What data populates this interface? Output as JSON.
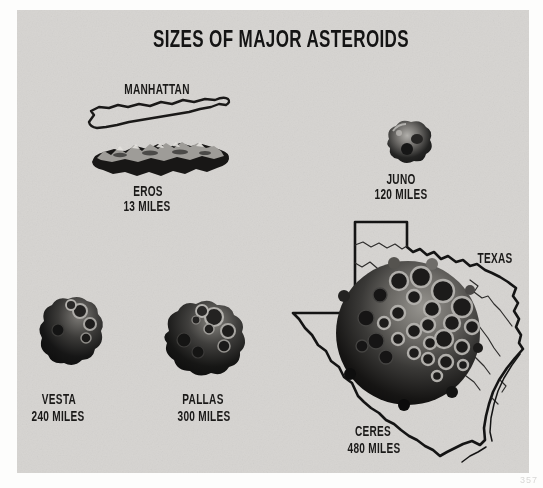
{
  "figure": {
    "title": "SIZES OF MAJOR ASTEROIDS",
    "manhattan_label": "MANHATTAN",
    "texas_label": "TEXAS",
    "asteroids": [
      {
        "name": "EROS",
        "size": "13 MILES"
      },
      {
        "name": "JUNO",
        "size": "120 MILES"
      },
      {
        "name": "VESTA",
        "size": "240 MILES"
      },
      {
        "name": "PALLAS",
        "size": "300 MILES"
      },
      {
        "name": "CERES",
        "size": "480 MILES"
      }
    ],
    "page_number": "357",
    "colors": {
      "panel_background": "#d6d4d1",
      "paper_white": "#fdfdfc",
      "ink": "#161616"
    }
  }
}
